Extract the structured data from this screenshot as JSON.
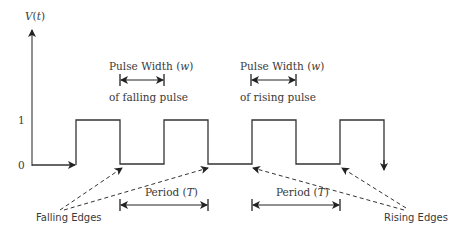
{
  "diagram": {
    "axis": {
      "y_label": "V",
      "y_label_arg": "t",
      "levels": [
        "1",
        "0"
      ]
    },
    "pulse_width_falling": {
      "line1": "Pulse Width (",
      "var": "w",
      "close": ")",
      "line2": "of falling pulse"
    },
    "pulse_width_rising": {
      "line1": "Pulse Width (",
      "var": "w",
      "close": ")",
      "line2": "of rising pulse"
    },
    "period_left": {
      "text": "Period (",
      "var": "T",
      "close": ")"
    },
    "period_right": {
      "text": "Period (",
      "var": "T",
      "close": ")"
    },
    "falling_edges_label": "Falling Edges",
    "rising_edges_label": "Rising Edges",
    "colors": {
      "line": "#333333",
      "text": "#3a3a3a",
      "background": "#ffffff"
    }
  }
}
